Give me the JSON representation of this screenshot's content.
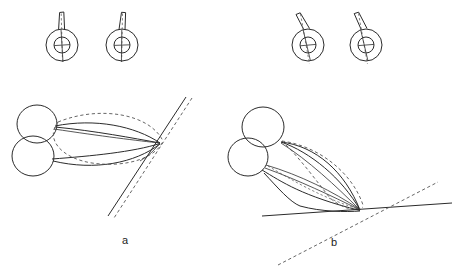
{
  "figure": {
    "type": "line-diagram",
    "width": 454,
    "height": 271,
    "background": "#ffffff",
    "ink_color": "#2b2b2b",
    "dash_color": "#555555",
    "panels": [
      {
        "id": "a",
        "label": "a",
        "label_x": 125,
        "label_y": 241,
        "description": "Two overlapping circles at left with two lens shapes converging to a point at right; a steeply inclined solid line and parallel dashed line pass through the convergence point.",
        "gauges": [
          {
            "id": "a-gauge-1",
            "cx": 62,
            "cy": 45,
            "outer_r": 16,
            "inner_r": 8,
            "needle_angle_deg": 4,
            "reference_angle_deg": 0
          },
          {
            "id": "a-gauge-2",
            "cx": 122,
            "cy": 45,
            "outer_r": 16,
            "inner_r": 8,
            "needle_angle_deg": 8,
            "reference_angle_deg": 0
          }
        ],
        "convergence_point": {
          "x": 160,
          "y": 143
        },
        "solid_line": {
          "x1": 186,
          "y1": 97,
          "x2": 108,
          "y2": 216
        },
        "dashed_line": {
          "x1": 192,
          "y1": 98,
          "x2": 114,
          "y2": 218
        }
      },
      {
        "id": "b",
        "label": "b",
        "label_x": 334,
        "label_y": 243,
        "description": "Same construction rotated downward; lens shapes are tilted and converge near a near-horizontal solid line, crossed by a dashed diagonal line.",
        "gauges": [
          {
            "id": "b-gauge-1",
            "cx": 308,
            "cy": 45,
            "outer_r": 16,
            "inner_r": 8,
            "needle_angle_deg": -18,
            "reference_angle_deg": 0
          },
          {
            "id": "b-gauge-2",
            "cx": 366,
            "cy": 45,
            "outer_r": 16,
            "inner_r": 8,
            "needle_angle_deg": -22,
            "reference_angle_deg": 0
          }
        ],
        "convergence_point": {
          "x": 360,
          "y": 210
        },
        "solid_line": {
          "x1": 262,
          "y1": 216,
          "x2": 452,
          "y2": 203
        },
        "dashed_line": {
          "x1": 278,
          "y1": 265,
          "x2": 438,
          "y2": 182
        }
      }
    ]
  },
  "labels": {
    "panel_a": "a",
    "panel_b": "b"
  }
}
